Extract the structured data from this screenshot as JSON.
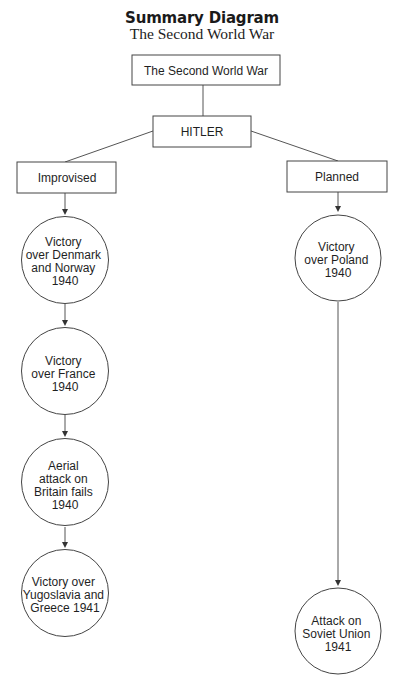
{
  "header": {
    "title": "Summary Diagram",
    "subtitle": "The Second World War"
  },
  "diagram": {
    "root": {
      "label": "The Second World War"
    },
    "leader": {
      "label": "HITLER"
    },
    "branches": [
      {
        "label": "Improvised",
        "events": [
          {
            "lines": [
              "Victory",
              "over Denmark",
              "and Norway",
              "1940"
            ]
          },
          {
            "lines": [
              "Victory",
              "over France",
              "1940"
            ]
          },
          {
            "lines": [
              "Aerial",
              "attack on",
              "Britain fails",
              "1940"
            ]
          },
          {
            "lines": [
              "Victory over",
              "Yugoslavia and",
              "Greece 1941"
            ]
          }
        ]
      },
      {
        "label": "Planned",
        "events": [
          {
            "lines": [
              "Victory",
              "over Poland",
              "1940"
            ]
          },
          {
            "lines": [
              "Attack on",
              "Soviet Union",
              "1941"
            ]
          }
        ]
      }
    ]
  }
}
